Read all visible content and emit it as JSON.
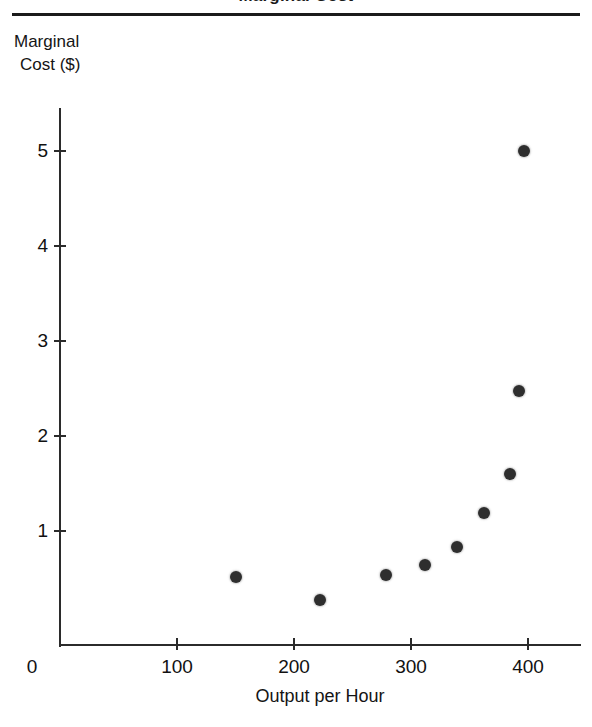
{
  "figure": {
    "title_fragment": "Marginal Cost",
    "top_rule": "horizontal-rule"
  },
  "chart_data": {
    "type": "scatter",
    "title": "Marginal Cost",
    "xlabel": "Output per Hour",
    "ylabel": "Marginal Cost ($)",
    "ylabel_lines": [
      "Marginal",
      "Cost ($)"
    ],
    "xlim": [
      0,
      445
    ],
    "ylim": [
      -0.2,
      5.45
    ],
    "grid": false,
    "legend": null,
    "xticks": [
      0,
      100,
      200,
      300,
      400
    ],
    "xticklabels": [
      "0",
      "100",
      "200",
      "300",
      "400"
    ],
    "yticks": [
      1,
      2,
      3,
      4,
      5
    ],
    "yticklabels": [
      "1",
      "2",
      "3",
      "4",
      "5"
    ],
    "series": [
      {
        "name": "Marginal Cost",
        "marker": "filled-circle",
        "color": "#2e2e2e",
        "points": [
          {
            "x": 150,
            "y": 0.52
          },
          {
            "x": 222,
            "y": 0.27
          },
          {
            "x": 279,
            "y": 0.54
          },
          {
            "x": 312,
            "y": 0.64
          },
          {
            "x": 339,
            "y": 0.83
          },
          {
            "x": 362,
            "y": 1.19
          },
          {
            "x": 385,
            "y": 1.6
          },
          {
            "x": 392,
            "y": 2.47
          },
          {
            "x": 397,
            "y": 5.0
          }
        ]
      }
    ]
  }
}
